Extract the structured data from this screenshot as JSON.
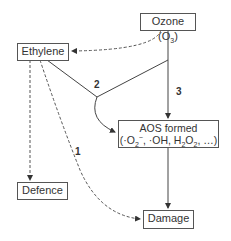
{
  "nodes": {
    "ozone": {
      "label": "Ozone (O",
      "sub": "3",
      "close": ")"
    },
    "ethylene": {
      "label": "Ethylene"
    },
    "aos": {
      "line1": "AOS formed",
      "line2_a": "(·O",
      "line2_sub1": "2",
      "line2_sup1": "−",
      "line2_b": ", ·OH, H",
      "line2_sub2": "2",
      "line2_c": "O",
      "line2_sub3": "2",
      "line2_d": ", …)"
    },
    "defence": {
      "label": "Defence"
    },
    "damage": {
      "label": "Damage"
    }
  },
  "edges": {
    "label_1": "1",
    "label_2": "2",
    "label_3": "3"
  },
  "colors": {
    "line": "#444444",
    "dashed": "#555555",
    "text": "#333333"
  }
}
